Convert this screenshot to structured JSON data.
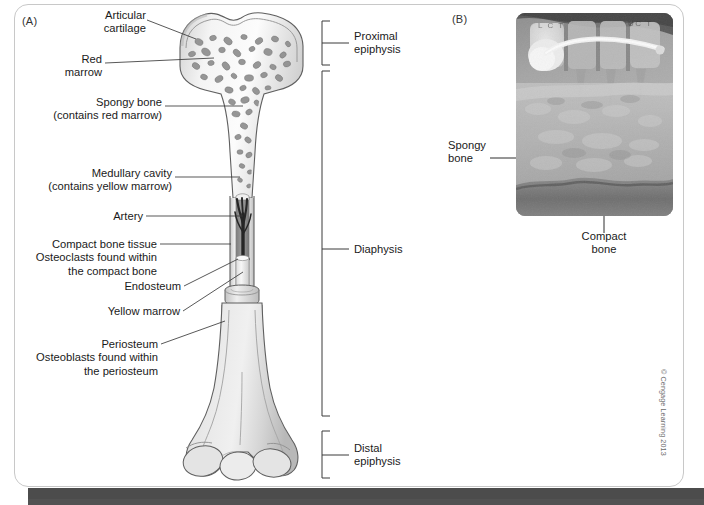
{
  "figure": {
    "panel_a": {
      "letter": "(A)",
      "labels_left": [
        {
          "id": "articular-cartilage",
          "text": "Articular\ncartilage"
        },
        {
          "id": "red-marrow",
          "text": "Red\nmarrow"
        },
        {
          "id": "spongy-bone",
          "text": "Spongy bone\n(contains red marrow)"
        },
        {
          "id": "medullary-cavity",
          "text": "Medullary cavity\n(contains yellow marrow)"
        },
        {
          "id": "artery",
          "text": "Artery"
        },
        {
          "id": "compact-bone-tissue",
          "text": "Compact bone tissue\nOsteoclasts found within\nthe compact bone"
        },
        {
          "id": "endosteum",
          "text": "Endosteum"
        },
        {
          "id": "yellow-marrow",
          "text": "Yellow marrow"
        },
        {
          "id": "periosteum",
          "text": "Periosteum\nOsteoblasts found within\nthe periosteum"
        }
      ],
      "labels_right": [
        {
          "id": "proximal-epiphysis",
          "text": "Proximal\nepiphysis"
        },
        {
          "id": "diaphysis",
          "text": "Diaphysis"
        },
        {
          "id": "distal-epiphysis",
          "text": "Distal\nepiphysis"
        }
      ]
    },
    "panel_b": {
      "letter": "(B)",
      "labels": [
        {
          "id": "spongy-bone-xray",
          "text": "Spongy\nbone"
        },
        {
          "id": "compact-bone-xray",
          "text": "Compact\nbone"
        }
      ],
      "xray_markings": [
        "L C T",
        "UC T"
      ]
    },
    "credit": "© Cengage Learning 2013",
    "colors": {
      "panel_border": "#c8c8c8",
      "label_text": "#1a1a1a",
      "leader_line": "#3a3a3a",
      "bone_outline": "#5a5a5a",
      "bone_fill_light": "#f2f2f2",
      "bone_fill_mid": "#d8d8d8",
      "bone_fill_dark": "#b4b4b4",
      "marrow_cavity": "#8d8d8d",
      "artery": "#2b2b2b",
      "footer_bar": "#4c4c4c",
      "xray_base": "#9a9a9a"
    }
  }
}
